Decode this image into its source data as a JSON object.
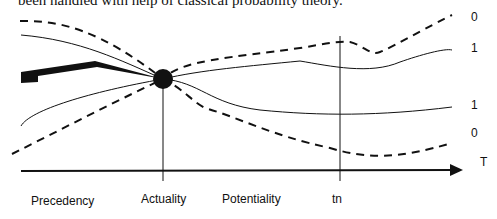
{
  "caption": "been handled with help of classical probability theory.",
  "diagram": {
    "axis_label": "T",
    "right_labels": [
      "0",
      "1",
      "1",
      "0"
    ],
    "bottom_labels": [
      "Precedency",
      "Actuality",
      "Potentiality",
      "tn"
    ],
    "colors": {
      "ink": "#111111",
      "background": "#ffffff"
    }
  }
}
